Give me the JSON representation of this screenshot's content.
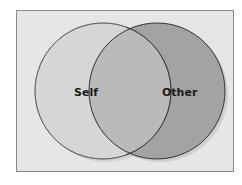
{
  "diagram": {
    "type": "venn",
    "circles": [
      {
        "id": "self",
        "label": "Self",
        "fill": "#d6d6d6",
        "stroke": "#8c8c8c"
      },
      {
        "id": "other",
        "label": "Other",
        "fill": "#a3a3a3",
        "stroke": "#333333"
      }
    ],
    "overlap_fill": "#bababa",
    "background": "#e6e6e6"
  }
}
